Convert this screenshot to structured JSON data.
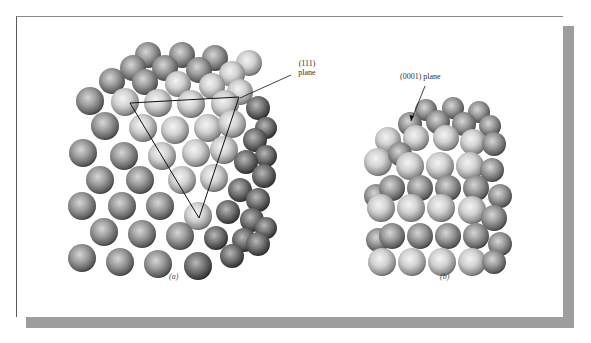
{
  "figure": {
    "panel_a": {
      "caption": "(a)",
      "label_line1": "(111)",
      "label_line2": "plane",
      "description": "Face-centered cubic close-packed cube with (111) plane triangle"
    },
    "panel_b": {
      "caption": "(b)",
      "label": "(0001) plane",
      "description": "Hexagonal close-packed stack"
    }
  },
  "colors": {
    "card_bg": "#ffffff",
    "shadow": "#9d9d9d",
    "sphere_light": "#e6e6e6",
    "sphere_mid": "#a8a8a8",
    "sphere_dark": "#4a4a4a",
    "line": "#111111"
  },
  "geometry": {
    "triangle": [
      [
        130,
        103
      ],
      [
        239,
        97
      ],
      [
        199,
        218
      ]
    ],
    "leader_111": [
      [
        240,
        98
      ],
      [
        291,
        75
      ]
    ],
    "arrow_0001": [
      [
        425,
        86
      ],
      [
        411,
        121
      ]
    ]
  },
  "spheres_a": [
    [
      148,
      55,
      13,
      "m"
    ],
    [
      182,
      55,
      13,
      "m"
    ],
    [
      215,
      58,
      13,
      "m"
    ],
    [
      249,
      63,
      13,
      "l"
    ],
    [
      133,
      68,
      13,
      "m"
    ],
    [
      165,
      68,
      13,
      "m"
    ],
    [
      199,
      70,
      13,
      "m"
    ],
    [
      232,
      74,
      13,
      "l"
    ],
    [
      112,
      81,
      13,
      "m"
    ],
    [
      145,
      82,
      13,
      "m"
    ],
    [
      178,
      84,
      13,
      "l"
    ],
    [
      212,
      86,
      13,
      "l"
    ],
    [
      240,
      92,
      13,
      "l"
    ],
    [
      90,
      101,
      14,
      "m"
    ],
    [
      125,
      102,
      14,
      "l"
    ],
    [
      158,
      103,
      14,
      "l"
    ],
    [
      191,
      104,
      14,
      "l"
    ],
    [
      225,
      104,
      14,
      "l"
    ],
    [
      258,
      108,
      12,
      "d"
    ],
    [
      266,
      128,
      11,
      "d"
    ],
    [
      105,
      126,
      14,
      "m"
    ],
    [
      143,
      128,
      14,
      "l"
    ],
    [
      175,
      130,
      14,
      "l"
    ],
    [
      208,
      128,
      14,
      "l"
    ],
    [
      232,
      124,
      14,
      "l"
    ],
    [
      255,
      140,
      12,
      "d"
    ],
    [
      266,
      156,
      11,
      "d"
    ],
    [
      83,
      153,
      14,
      "m"
    ],
    [
      124,
      156,
      14,
      "m"
    ],
    [
      162,
      156,
      14,
      "l"
    ],
    [
      196,
      153,
      14,
      "l"
    ],
    [
      224,
      150,
      14,
      "l"
    ],
    [
      246,
      162,
      12,
      "d"
    ],
    [
      264,
      176,
      12,
      "d"
    ],
    [
      100,
      180,
      14,
      "m"
    ],
    [
      140,
      180,
      14,
      "m"
    ],
    [
      182,
      180,
      14,
      "l"
    ],
    [
      214,
      178,
      14,
      "l"
    ],
    [
      240,
      190,
      12,
      "d"
    ],
    [
      258,
      200,
      12,
      "d"
    ],
    [
      82,
      206,
      14,
      "m"
    ],
    [
      122,
      206,
      14,
      "m"
    ],
    [
      160,
      206,
      14,
      "m"
    ],
    [
      198,
      216,
      14,
      "l"
    ],
    [
      228,
      212,
      12,
      "d"
    ],
    [
      252,
      220,
      12,
      "d"
    ],
    [
      266,
      228,
      11,
      "d"
    ],
    [
      104,
      232,
      14,
      "m"
    ],
    [
      142,
      234,
      14,
      "m"
    ],
    [
      180,
      236,
      14,
      "m"
    ],
    [
      216,
      238,
      12,
      "d"
    ],
    [
      244,
      240,
      12,
      "d"
    ],
    [
      82,
      258,
      14,
      "m"
    ],
    [
      120,
      262,
      14,
      "m"
    ],
    [
      158,
      264,
      14,
      "m"
    ],
    [
      198,
      266,
      14,
      "d"
    ],
    [
      232,
      256,
      12,
      "d"
    ],
    [
      258,
      244,
      12,
      "d"
    ]
  ],
  "spheres_b": [
    [
      426,
      110,
      11,
      "m"
    ],
    [
      453,
      108,
      11,
      "m"
    ],
    [
      479,
      112,
      11,
      "m"
    ],
    [
      410,
      124,
      12,
      "m"
    ],
    [
      438,
      122,
      12,
      "m"
    ],
    [
      464,
      124,
      12,
      "m"
    ],
    [
      490,
      126,
      11,
      "m"
    ],
    [
      388,
      140,
      13,
      "l"
    ],
    [
      416,
      138,
      13,
      "l"
    ],
    [
      446,
      138,
      13,
      "l"
    ],
    [
      473,
      142,
      13,
      "l"
    ],
    [
      494,
      144,
      12,
      "m"
    ],
    [
      378,
      162,
      14,
      "l"
    ],
    [
      400,
      154,
      12,
      "m"
    ],
    [
      410,
      166,
      14,
      "l"
    ],
    [
      440,
      166,
      14,
      "l"
    ],
    [
      470,
      166,
      14,
      "l"
    ],
    [
      492,
      170,
      12,
      "m"
    ],
    [
      376,
      196,
      12,
      "m"
    ],
    [
      392,
      188,
      13,
      "m"
    ],
    [
      420,
      188,
      13,
      "m"
    ],
    [
      448,
      188,
      13,
      "m"
    ],
    [
      476,
      188,
      13,
      "m"
    ],
    [
      500,
      196,
      12,
      "m"
    ],
    [
      381,
      208,
      14,
      "l"
    ],
    [
      411,
      208,
      14,
      "l"
    ],
    [
      441,
      208,
      14,
      "l"
    ],
    [
      472,
      210,
      14,
      "l"
    ],
    [
      494,
      218,
      13,
      "m"
    ],
    [
      378,
      240,
      12,
      "m"
    ],
    [
      392,
      236,
      13,
      "m"
    ],
    [
      420,
      236,
      13,
      "m"
    ],
    [
      448,
      236,
      13,
      "m"
    ],
    [
      476,
      236,
      13,
      "m"
    ],
    [
      500,
      244,
      12,
      "m"
    ],
    [
      382,
      262,
      14,
      "l"
    ],
    [
      412,
      262,
      14,
      "l"
    ],
    [
      442,
      262,
      14,
      "l"
    ],
    [
      472,
      262,
      14,
      "l"
    ],
    [
      494,
      262,
      12,
      "m"
    ]
  ]
}
